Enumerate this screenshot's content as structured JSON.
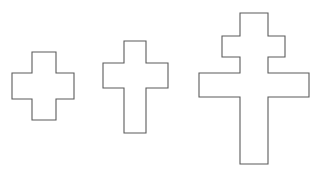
{
  "figure": {
    "title": "Cross shapes outline figure",
    "background_color": "#ffffff",
    "stroke_color": "#5b5b5b",
    "fill_color": "#ffffff",
    "stroke_width": 1.1,
    "width": 314,
    "height": 176,
    "shape_count": 3,
    "shapes": [
      {
        "id": "cross-greek",
        "name": "Greek cross",
        "order_label": "1",
        "bounds": {
          "x": 12,
          "y": 52,
          "width": 62,
          "height": 68
        },
        "vertical_bar": {
          "x1": 32,
          "x2": 56,
          "y1": 52,
          "y2": 120
        },
        "horizontal_bar": {
          "x1": 12,
          "x2": 74,
          "y1": 73,
          "y2": 99
        },
        "points": "32,52 56,52 56,73 74,73 74,99 56,99 56,120 32,120 32,99 12,99 12,73 32,73"
      },
      {
        "id": "cross-latin",
        "name": "Latin cross",
        "order_label": "2",
        "bounds": {
          "x": 103,
          "y": 41,
          "width": 65,
          "height": 92
        },
        "vertical_bar": {
          "x1": 124,
          "x2": 146,
          "y1": 41,
          "y2": 133
        },
        "horizontal_bar": {
          "x1": 103,
          "x2": 168,
          "y1": 63,
          "y2": 88
        },
        "points": "124,41 146,41 146,63 168,63 168,88 146,88 146,133 124,133 124,88 103,88 103,63 124,63"
      },
      {
        "id": "cross-patriarchal",
        "name": "Patriarchal two-barred cross",
        "order_label": "3",
        "bounds": {
          "x": 199,
          "y": 13,
          "width": 110,
          "height": 151
        },
        "vertical_bar": {
          "x1": 240,
          "x2": 268,
          "y1": 13,
          "y2": 164
        },
        "upper_bar": {
          "x1": 222,
          "x2": 285,
          "y1": 36,
          "y2": 57
        },
        "lower_bar": {
          "x1": 199,
          "x2": 309,
          "y1": 73,
          "y2": 97
        },
        "points": "240,13 268,13 268,36 285,36 285,57 268,57 268,73 309,73 309,97 268,97 268,164 240,164 240,97 199,97 199,73 240,73 240,57 222,57 222,36 240,36"
      }
    ]
  }
}
